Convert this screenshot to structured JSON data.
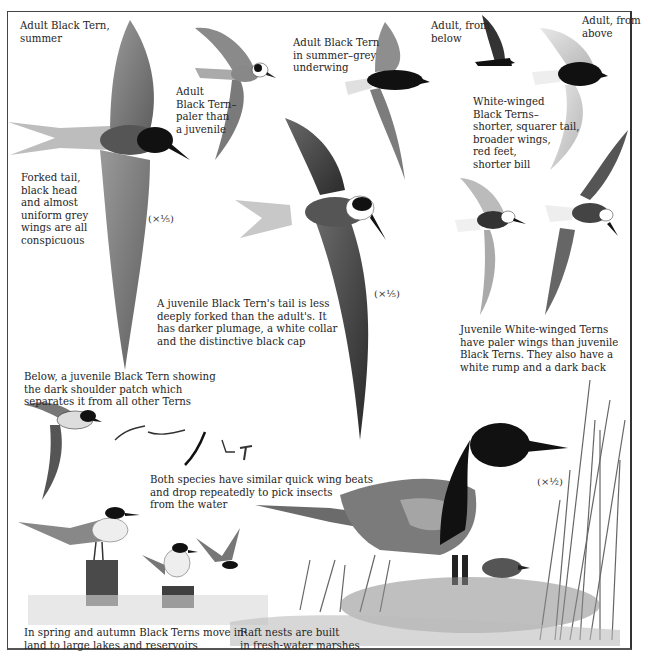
{
  "captions": {
    "adult_summer": "Adult Black Tern,\nsummer",
    "adult_paler": "Adult\nBlack Tern–\npaler than\na juvenile",
    "adult_grey_underwing": "Adult Black Tern\nin summer–grey\nunderwing",
    "adult_from_below": "Adult, from\nbelow",
    "adult_from_above": "Adult, from\nabove",
    "white_winged": "White-winged\nBlack Terns–\nshorter, squarer tail,\nbroader wings,\nred feet,\nshorter bill",
    "forked_tail": "Forked tail,\nblack head\nand almost\nuniform grey\nwings are all\nconspicuous",
    "juvenile_black_tern": "A juvenile Black Tern's tail is less\ndeeply forked than the adult's. It\nhas darker plumage, a white collar\nand the distinctive black cap",
    "juvenile_white_winged": "Juvenile White-winged Terns\nhave paler wings than juvenile\nBlack Terns. They also have a\nwhite rump and a dark back",
    "shoulder_patch": "Below, a juvenile Black Tern showing\nthe dark shoulder patch which\nseparates it from all other Terns",
    "wing_beats": "Both species have similar quick wing beats\nand drop repeatedly to pick insects\nfrom the water",
    "spring_autumn": "In spring and autumn Black Terns move in-\nland to large lakes and reservoirs",
    "raft_nests": "Raft nests are built\nin fresh-water marshes"
  },
  "scales": {
    "scale_1": "(×⅕)",
    "scale_2": "(×⅕)",
    "scale_3": "(×½)"
  }
}
